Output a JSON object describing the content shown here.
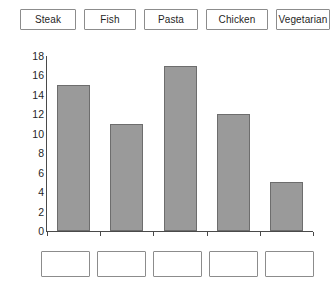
{
  "label_bank": {
    "tiles": [
      {
        "label": "Steak",
        "x": 20,
        "width": 56
      },
      {
        "label": "Fish",
        "x": 84,
        "width": 52
      },
      {
        "label": "Pasta",
        "x": 144,
        "width": 54
      },
      {
        "label": "Chicken",
        "x": 206,
        "width": 62
      },
      {
        "label": "Vegetarian",
        "x": 276,
        "width": 54
      }
    ]
  },
  "drop_zone": {
    "boxes": [
      {
        "value": "",
        "x": 41,
        "width": 49
      },
      {
        "value": "",
        "x": 97,
        "width": 49
      },
      {
        "value": "",
        "x": 153,
        "width": 49
      },
      {
        "value": "",
        "x": 209,
        "width": 49
      },
      {
        "value": "",
        "x": 265,
        "width": 49
      }
    ]
  },
  "chart_data": {
    "type": "bar",
    "title": "",
    "xlabel": "",
    "ylabel": "",
    "categories": [
      "Steak",
      "Fish",
      "Pasta",
      "Chicken",
      "Vegetarian"
    ],
    "values": [
      15,
      11,
      17,
      12,
      5
    ],
    "ylim": [
      0,
      18
    ],
    "ytick_step": 2,
    "yticks": [
      18,
      16,
      14,
      12,
      10,
      8,
      6,
      4,
      2,
      0
    ],
    "grid": false,
    "legend": false,
    "bar_fill": "#9a9a9a",
    "bar_border": "#6d6d6d",
    "axis_color": "#4a4a4a",
    "categories_hidden": true
  }
}
